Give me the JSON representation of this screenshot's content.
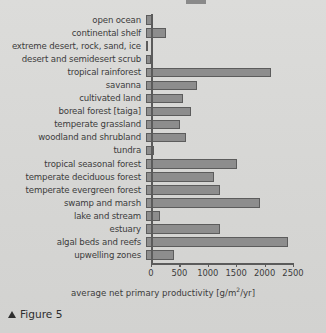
{
  "figure": {
    "caption_marker": "▲",
    "caption_text": "Figure 5"
  },
  "axis": {
    "x_caption_main": "average net primary productivity [g/m",
    "x_caption_sup": "2",
    "x_caption_tail": "/yr]",
    "ticks": [
      "0",
      "500",
      "1000",
      "1500",
      "2000",
      "2500"
    ]
  },
  "chart_data": {
    "type": "bar",
    "orientation": "horizontal",
    "title": "",
    "xlabel": "average net primary productivity [g/m2/yr]",
    "ylabel": "",
    "xlim": [
      0,
      2650
    ],
    "grid": false,
    "legend": "none",
    "bar_color": "#8d8d8d",
    "bar_edge_color": "#5c5c5c",
    "background_color": "#d9d9d7",
    "xticks": [
      0,
      500,
      1000,
      1500,
      2000,
      2500
    ],
    "categories": [
      "open ocean",
      "continental shelf",
      "extreme desert, rock, sand, ice",
      "desert and semidesert scrub",
      "tropical rainforest",
      "savanna",
      "cultivated land",
      "boreal forest [taiga]",
      "temperate grassland",
      "woodland and shrubland",
      "tundra",
      "tropical seasonal forest",
      "temperate deciduous forest",
      "temperate evergreen forest",
      "swamp and marsh",
      "lake and stream",
      "estuary",
      "algal beds and reefs",
      "upwelling zones"
    ],
    "values": [
      125,
      360,
      30,
      90,
      2200,
      900,
      650,
      800,
      600,
      700,
      140,
      1600,
      1200,
      1300,
      2000,
      250,
      1300,
      2500,
      500
    ]
  }
}
